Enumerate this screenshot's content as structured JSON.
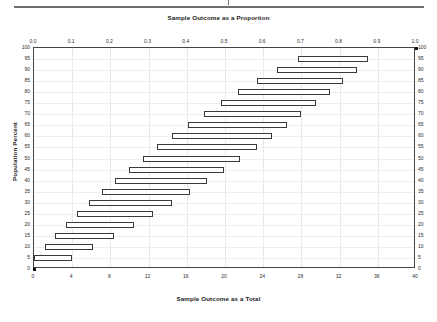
{
  "chart_data": {
    "type": "bar",
    "orientation": "horizontal",
    "title": "",
    "top_axis": {
      "label": "Sample Outcome as a Proportion",
      "ticks": [
        "0.0",
        "0.1",
        "0.2",
        "0.3",
        "0.4",
        "0.5",
        "0.6",
        "0.7",
        "0.8",
        "0.9",
        "1.0"
      ],
      "range": [
        0,
        1
      ]
    },
    "bottom_axis": {
      "label": "Sample Outcome as a Total",
      "ticks": [
        "0",
        "4",
        "8",
        "12",
        "16",
        "20",
        "24",
        "28",
        "32",
        "36",
        "40"
      ],
      "range": [
        0,
        40
      ]
    },
    "left_axis": {
      "label": "Population Percent",
      "ticks": [
        "0",
        "5",
        "10",
        "15",
        "20",
        "25",
        "30",
        "35",
        "40",
        "45",
        "50",
        "55",
        "60",
        "65",
        "70",
        "75",
        "80",
        "85",
        "90",
        "95",
        "100"
      ],
      "range": [
        0,
        100
      ]
    },
    "right_axis": {
      "label": "",
      "ticks": [
        "0",
        "5",
        "10",
        "15",
        "20",
        "25",
        "30",
        "35",
        "40",
        "45",
        "50",
        "55",
        "60",
        "65",
        "70",
        "75",
        "80",
        "85",
        "90",
        "95",
        "100"
      ],
      "range": [
        0,
        100
      ]
    },
    "grid": true,
    "legend": null,
    "xlabel": "Sample Outcome as a Total",
    "ylabel": "Population Percent",
    "xlim": [
      0,
      40
    ],
    "ylim": [
      0,
      100
    ],
    "series": [
      {
        "name": "Confidence interval of sample outcome",
        "categories": [
          0,
          5,
          10,
          15,
          20,
          25,
          30,
          35,
          40,
          45,
          50,
          55,
          60,
          65,
          70,
          75,
          80,
          85,
          90,
          95,
          100
        ],
        "intervals": [
          {
            "y": 0,
            "low": 0.0,
            "high": 0.0,
            "point": 0.0
          },
          {
            "y": 5,
            "low": 0.0,
            "high": 4.0
          },
          {
            "y": 10,
            "low": 1.2,
            "high": 6.2
          },
          {
            "y": 15,
            "low": 2.2,
            "high": 8.4
          },
          {
            "y": 20,
            "low": 3.3,
            "high": 10.5
          },
          {
            "y": 25,
            "low": 4.5,
            "high": 12.5
          },
          {
            "y": 30,
            "low": 5.8,
            "high": 14.4
          },
          {
            "y": 35,
            "low": 7.1,
            "high": 16.3
          },
          {
            "y": 40,
            "low": 8.5,
            "high": 18.1
          },
          {
            "y": 45,
            "low": 9.9,
            "high": 19.9
          },
          {
            "y": 50,
            "low": 11.4,
            "high": 21.6
          },
          {
            "y": 55,
            "low": 12.9,
            "high": 23.3
          },
          {
            "y": 60,
            "low": 14.5,
            "high": 24.9
          },
          {
            "y": 65,
            "low": 16.1,
            "high": 26.5
          },
          {
            "y": 70,
            "low": 17.8,
            "high": 28.0
          },
          {
            "y": 75,
            "low": 19.6,
            "high": 29.5
          },
          {
            "y": 80,
            "low": 21.4,
            "high": 31.0
          },
          {
            "y": 85,
            "low": 23.3,
            "high": 32.4
          },
          {
            "y": 90,
            "low": 25.4,
            "high": 33.8
          },
          {
            "y": 95,
            "low": 27.6,
            "high": 35.0
          },
          {
            "y": 100,
            "low": 40.0,
            "high": 40.0,
            "point": 40.0
          }
        ]
      }
    ],
    "colors": {
      "bar_fill": "#ffffff",
      "bar_stroke": "#3a3a3a",
      "grid": "#e8e8e8",
      "axis": "#444444",
      "text": "#1a1a1a",
      "marker": "#111111",
      "header_rule": "#6e6e6e"
    }
  }
}
